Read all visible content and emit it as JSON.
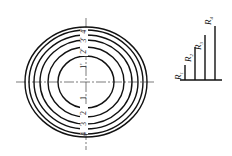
{
  "diagram": {
    "type": "concentric-circles-with-radius-bars",
    "center": {
      "x": 86,
      "y": 82
    },
    "circles": [
      {
        "id": "1",
        "rx": 28,
        "ry": 26
      },
      {
        "id": "2",
        "rx": 38,
        "ry": 35
      },
      {
        "id": "3",
        "rx": 46,
        "ry": 42
      },
      {
        "id": "3b",
        "rx": 52,
        "ry": 47
      },
      {
        "id": "4",
        "rx": 57,
        "ry": 52
      },
      {
        "id": "4b",
        "rx": 61,
        "ry": 55
      }
    ],
    "ring_labels_top": [
      "1'",
      "2'",
      "3'",
      "4'"
    ],
    "ring_labels_bottom": [
      "1",
      "2",
      "3",
      "4"
    ],
    "radius_bars": [
      {
        "label": "R",
        "sub": "1",
        "x": 185,
        "top": 65
      },
      {
        "label": "R",
        "sub": "2",
        "x": 195,
        "top": 47
      },
      {
        "label": "R",
        "sub": "3",
        "x": 205,
        "top": 35
      },
      {
        "label": "R",
        "sub": "4",
        "x": 215,
        "top": 26
      }
    ],
    "baseline": {
      "y": 80,
      "x1": 180,
      "x2": 222
    }
  }
}
